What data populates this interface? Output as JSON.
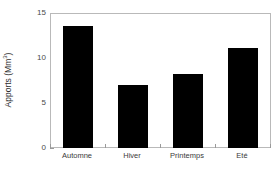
{
  "chart_data": {
    "type": "bar",
    "title": "",
    "xlabel": "",
    "ylabel": "Apports (Mm",
    "ylabel_sup": "3",
    "ylabel_suffix": ")",
    "ylabel_full": "Apports (Mm3)",
    "categories": [
      "Automne",
      "Hiver",
      "Printemps",
      "Eté"
    ],
    "values": [
      13.6,
      7.0,
      8.2,
      11.1
    ],
    "ylim": [
      0,
      15
    ],
    "yticks": [
      0,
      5,
      10,
      15
    ],
    "ytick_labels": [
      "0",
      "5",
      "10",
      "15"
    ],
    "grid": false,
    "legend": null,
    "bar_color": "#000000",
    "frame_color": "#b9b9b9",
    "tick_color": "#9a9a9a",
    "background": "#ffffff"
  }
}
